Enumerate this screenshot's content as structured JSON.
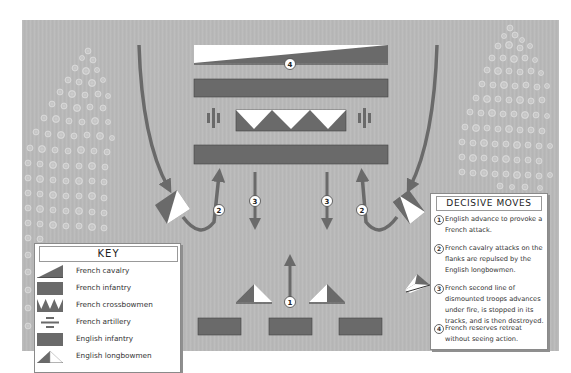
{
  "diagram": {
    "colors": {
      "background": "#b9b9b9",
      "unit_dark": "#6a6a6a",
      "unit_white": "#ffffff",
      "arrow": "#6a6a6a",
      "trees": "#c9c9c9"
    },
    "markers": [
      {
        "id": "1",
        "label": "1"
      },
      {
        "id": "2-left",
        "label": "2"
      },
      {
        "id": "2-right",
        "label": "2"
      },
      {
        "id": "3-left",
        "label": "3"
      },
      {
        "id": "3-right",
        "label": "3"
      },
      {
        "id": "4",
        "label": "4"
      }
    ]
  },
  "key": {
    "title": "KEY",
    "items": [
      {
        "icon": "french-cavalry-icon",
        "label": "French cavalry"
      },
      {
        "icon": "french-infantry-icon",
        "label": "French infantry"
      },
      {
        "icon": "french-crossbowmen-icon",
        "label": "French crossbowmen"
      },
      {
        "icon": "french-artillery-icon",
        "label": "French artillery"
      },
      {
        "icon": "english-infantry-icon",
        "label": "English infantry"
      },
      {
        "icon": "english-longbowmen-icon",
        "label": "English longbowmen"
      }
    ]
  },
  "decisive_moves": {
    "title": "DECISIVE MOVES",
    "items": [
      {
        "num": "1",
        "text": "English advance to provoke a French attack."
      },
      {
        "num": "2",
        "text": "French cavalry attacks on the flanks are repulsed by the English longbowmen."
      },
      {
        "num": "3",
        "text": "French second line of dismounted troops advances under fire, is stopped in its tracks, and is then destroyed."
      },
      {
        "num": "4",
        "text": "French reserves retreat without seeing action."
      }
    ]
  }
}
